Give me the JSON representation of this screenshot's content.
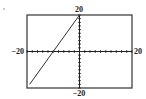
{
  "chart_data": {
    "type": "line",
    "title": "",
    "xlabel": "",
    "ylabel": "",
    "xlim": [
      -20,
      20
    ],
    "ylim": [
      -20,
      20
    ],
    "xscale_tick": 2,
    "yscale_tick": 2,
    "grid": false,
    "tick_labels": {
      "xmin": "−20",
      "xmax": "20",
      "ymin": "−20",
      "ymax": "20"
    },
    "series": [
      {
        "name": "y = 2x + 20",
        "x": [
          -19,
          0
        ],
        "y": [
          -18,
          20
        ]
      }
    ],
    "colors": {
      "axis": "#222222",
      "frame": "#333333",
      "line": "#333333"
    }
  }
}
